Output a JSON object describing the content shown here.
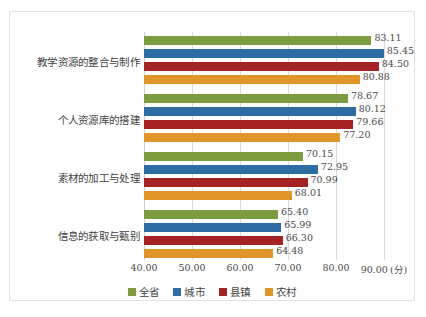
{
  "chart_data": {
    "type": "bar",
    "orientation": "horizontal",
    "title": "",
    "xlabel": "(分)",
    "ylabel": "",
    "xlim": [
      40.0,
      92.5
    ],
    "xticks": [
      "40.00",
      "50.00",
      "60.00",
      "70.00",
      "80.00",
      "90.00"
    ],
    "xtick_values": [
      40,
      50,
      60,
      70,
      80,
      90
    ],
    "grid": true,
    "legend_position": "bottom",
    "categories": [
      "教学资源的整合与制作",
      "个人资源库的搭建",
      "素材的加工与处理",
      "信息的获取与甄别"
    ],
    "series": [
      {
        "name": "全省",
        "color": "#7d9b3f",
        "values": [
          83.11,
          78.67,
          70.15,
          65.4
        ],
        "labels": [
          "83.11",
          "78.67",
          "70.15",
          "65.40"
        ]
      },
      {
        "name": "城市",
        "color": "#2e6da4",
        "values": [
          85.45,
          80.12,
          72.95,
          65.99
        ],
        "labels": [
          "85.45",
          "80.12",
          "72.95",
          "65.99"
        ]
      },
      {
        "name": "县镇",
        "color": "#a52324",
        "values": [
          84.5,
          79.66,
          70.99,
          66.3
        ],
        "labels": [
          "84.50",
          "79.66",
          "70.99",
          "66.30"
        ]
      },
      {
        "name": "农村",
        "color": "#e09628",
        "values": [
          80.88,
          77.2,
          68.01,
          64.48
        ],
        "labels": [
          "80.88",
          "77.20",
          "68.01",
          "64.48"
        ]
      }
    ]
  }
}
